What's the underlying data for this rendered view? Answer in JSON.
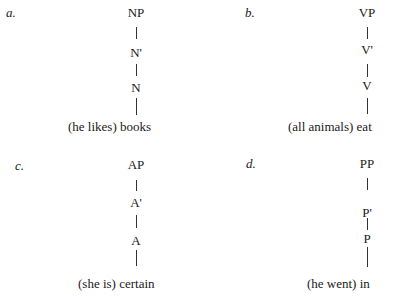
{
  "trees": [
    {
      "label": "a.",
      "nodes": [
        "NP",
        "N'",
        "N"
      ],
      "leaf": "(he likes) books"
    },
    {
      "label": "b.",
      "nodes": [
        "VP",
        "V'",
        "V"
      ],
      "leaf": "(all animals) eat"
    },
    {
      "label": "c.",
      "nodes": [
        "AP",
        "A'",
        "A"
      ],
      "leaf": "(she is) certain"
    },
    {
      "label": "d.",
      "nodes": [
        "PP",
        "P'",
        "P"
      ],
      "leaf": "(he went) in"
    }
  ]
}
